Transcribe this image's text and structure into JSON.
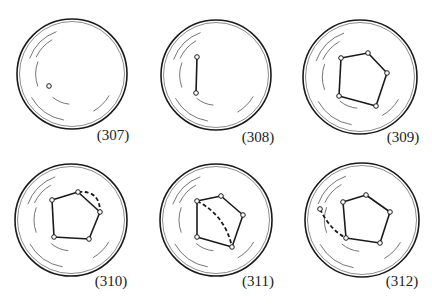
{
  "figures": [
    {
      "label": "(307)",
      "cx": 72,
      "cy": 74,
      "r": 55,
      "label_x": 113,
      "label_y": 135,
      "points": [
        [
          49,
          86
        ]
      ],
      "edges": [],
      "dashed": []
    },
    {
      "label": "(308)",
      "cx": 216,
      "cy": 75,
      "r": 55,
      "label_x": 258,
      "label_y": 137,
      "points": [
        [
          197,
          57
        ],
        [
          196,
          93
        ]
      ],
      "edges": [
        [
          0,
          1
        ]
      ],
      "dashed": []
    },
    {
      "label": "(309)",
      "cx": 360,
      "cy": 77,
      "r": 57,
      "label_x": 403,
      "label_y": 137,
      "points": [
        [
          341,
          58
        ],
        [
          368,
          53
        ],
        [
          387,
          73
        ],
        [
          376,
          106
        ],
        [
          339,
          96
        ]
      ],
      "edges": [
        [
          0,
          1
        ],
        [
          1,
          2
        ],
        [
          2,
          3
        ],
        [
          3,
          4
        ],
        [
          4,
          0
        ]
      ],
      "dashed": []
    },
    {
      "label": "(310)",
      "cx": 71,
      "cy": 220,
      "r": 56,
      "label_x": 111,
      "label_y": 281,
      "points": [
        [
          52,
          200
        ],
        [
          78,
          192
        ],
        [
          100,
          212
        ],
        [
          89,
          239
        ],
        [
          54,
          237
        ]
      ],
      "edges": [
        [
          0,
          1
        ],
        [
          1,
          2
        ],
        [
          2,
          3
        ],
        [
          3,
          4
        ],
        [
          4,
          0
        ]
      ],
      "dashed": [
        {
          "from": [
            78,
            192
          ],
          "ctrl": [
            100,
            190
          ],
          "to": [
            100,
            212
          ]
        }
      ]
    },
    {
      "label": "(311)",
      "cx": 216,
      "cy": 220,
      "r": 56,
      "label_x": 258,
      "label_y": 281,
      "points": [
        [
          197,
          201
        ],
        [
          221,
          196
        ],
        [
          243,
          215
        ],
        [
          232,
          247
        ],
        [
          197,
          237
        ]
      ],
      "edges": [
        [
          0,
          1
        ],
        [
          1,
          2
        ],
        [
          2,
          3
        ],
        [
          3,
          4
        ],
        [
          4,
          0
        ]
      ],
      "dashed": [
        {
          "from": [
            197,
            201
          ],
          "ctrl": [
            225,
            215
          ],
          "to": [
            232,
            247
          ]
        }
      ]
    },
    {
      "label": "(312)",
      "cx": 362,
      "cy": 220,
      "r": 57,
      "label_x": 402,
      "label_y": 281,
      "points": [
        [
          343,
          202
        ],
        [
          366,
          195
        ],
        [
          390,
          212
        ],
        [
          380,
          243
        ],
        [
          346,
          238
        ],
        [
          320,
          209
        ]
      ],
      "edges": [
        [
          0,
          1
        ],
        [
          1,
          2
        ],
        [
          2,
          3
        ],
        [
          3,
          4
        ],
        [
          4,
          0
        ]
      ],
      "dashed": [
        {
          "from": [
            320,
            209
          ],
          "ctrl": [
            330,
            230
          ],
          "to": [
            346,
            238
          ]
        }
      ]
    }
  ],
  "colors": {
    "stroke": "#1a1a1a",
    "background": "#ffffff"
  }
}
